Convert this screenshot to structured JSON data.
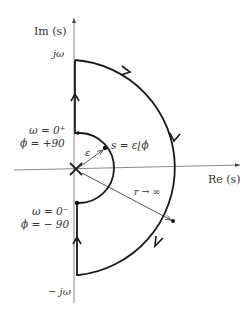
{
  "diagram": {
    "axes": {
      "imag_label": "Im (s)",
      "real_label": "Re (s)"
    },
    "labels": {
      "j_omega": "jω",
      "neg_j_omega": "− jω",
      "omega_zero_plus": "ω = 0⁺",
      "phi_plus_90": "ϕ = +90",
      "omega_zero_minus": "ω = 0⁻",
      "phi_minus_90": "ϕ = − 90",
      "epsilon": "ε",
      "s_equals": "s = ε⌊ϕ",
      "r_to_infinity": "r → ∞"
    },
    "colors": {
      "contour": "#1a1a1a",
      "axis": "#8a8a8a",
      "text": "#333333"
    }
  }
}
